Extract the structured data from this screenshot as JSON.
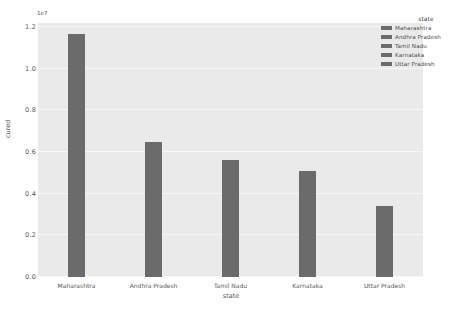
{
  "chart_data": {
    "type": "bar",
    "title": "",
    "xlabel": "state",
    "ylabel": "cured",
    "y_offset_text": "1e7",
    "categories": [
      "Maharashtra",
      "Andhra Pradesh",
      "Tamil Nadu",
      "Karnataka",
      "Uttar Pradesh"
    ],
    "values": [
      1.165,
      0.65,
      0.56,
      0.51,
      0.34
    ],
    "ylim": [
      0.0,
      1.22
    ],
    "yticks": [
      "0.0",
      "0.2",
      "0.4",
      "0.6",
      "0.8",
      "1.0",
      "1.2"
    ],
    "ytick_values": [
      0.0,
      0.2,
      0.4,
      0.6,
      0.8,
      1.0,
      1.2
    ],
    "grid": true,
    "legend_position": "upper right",
    "bar_color": "#6b6b6b",
    "plot_background": "#eaeaea",
    "figure_background": "#ffffff"
  },
  "legend": {
    "title": "state",
    "entries": [
      {
        "label": "Maharashtra",
        "color": "#6b6b6b"
      },
      {
        "label": "Andhra Pradesh",
        "color": "#6b6b6b"
      },
      {
        "label": "Tamil Nadu",
        "color": "#6b6b6b"
      },
      {
        "label": "Karnataka",
        "color": "#6b6b6b"
      },
      {
        "label": "Uttar Pradesh",
        "color": "#6b6b6b"
      }
    ]
  }
}
